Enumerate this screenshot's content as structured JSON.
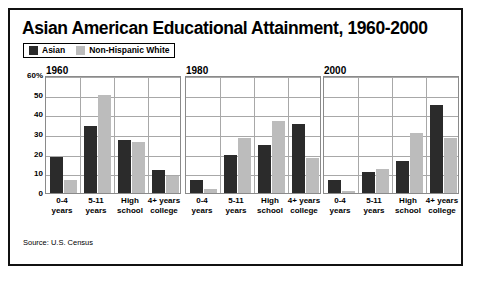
{
  "figure": {
    "title": "Asian American Educational Attainment, 1960-2000",
    "source": "Source: U.S. Census",
    "border_color": "#111111",
    "background": "#ffffff"
  },
  "legend": {
    "entries": [
      {
        "label": "Asian",
        "color": "#2b2b2b",
        "swatch_name": "legend-swatch-asian"
      },
      {
        "label": "Non-Hispanic White",
        "color": "#bcbcbc",
        "swatch_name": "legend-swatch-non-hispanic-white"
      }
    ]
  },
  "axis": {
    "y_ticks": [
      "60%",
      "50",
      "40",
      "30",
      "20",
      "10",
      "0"
    ],
    "y_tick_values": [
      60,
      50,
      40,
      30,
      20,
      10,
      0
    ]
  },
  "chart_data": {
    "type": "bar",
    "title": "Asian American Educational Attainment, 1960-2000",
    "subtitle": "",
    "xlabel": "",
    "ylabel": "",
    "ylim": [
      0,
      60
    ],
    "yticks": [
      0,
      10,
      20,
      30,
      40,
      50,
      60
    ],
    "ytick_labels": [
      "0",
      "10",
      "20",
      "30",
      "40",
      "50",
      "60%"
    ],
    "grid": true,
    "legend_position": "top-left",
    "units": "percent",
    "categories": [
      "0-4 years",
      "5-11 years",
      "High school",
      "4+ years college"
    ],
    "series_names": [
      "Asian",
      "Non-Hispanic White"
    ],
    "series_colors": [
      "#2b2b2b",
      "#bcbcbc"
    ],
    "panels": [
      {
        "label": "1960",
        "categories": [
          "0-4 years",
          "5-11 years",
          "High school",
          "4+ years college"
        ],
        "series": [
          {
            "name": "Asian",
            "values": [
              18.5,
              34,
              27,
              11.5
            ]
          },
          {
            "name": "Non-Hispanic White",
            "values": [
              6.5,
              50,
              26,
              8.5
            ]
          }
        ]
      },
      {
        "label": "1980",
        "categories": [
          "0-4 years",
          "5-11 years",
          "High school",
          "4+ years college"
        ],
        "series": [
          {
            "name": "Asian",
            "values": [
              6.5,
              19.5,
              24.5,
              35
            ]
          },
          {
            "name": "Non-Hispanic White",
            "values": [
              2,
              28,
              36.5,
              18
            ]
          }
        ]
      },
      {
        "label": "2000",
        "categories": [
          "0-4 years",
          "5-11 years",
          "High school",
          "4+ years college"
        ],
        "series": [
          {
            "name": "Asian",
            "values": [
              6.5,
              10.5,
              16.5,
              44.5
            ]
          },
          {
            "name": "Non-Hispanic White",
            "values": [
              1,
              12,
              30.5,
              28
            ]
          }
        ]
      }
    ]
  }
}
